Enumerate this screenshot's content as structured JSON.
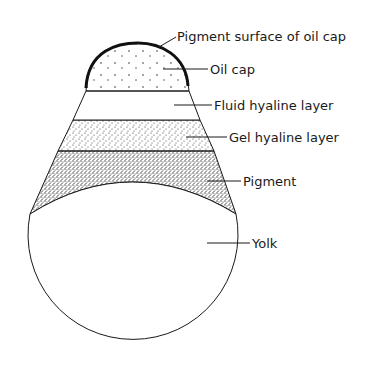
{
  "diagram": {
    "type": "labeled-cross-section",
    "labels": [
      {
        "id": "pigment-surface",
        "text": "Pigment surface of oil cap"
      },
      {
        "id": "oil-cap",
        "text": "Oil cap"
      },
      {
        "id": "fluid-hyaline",
        "text": "Fluid hyaline layer"
      },
      {
        "id": "gel-hyaline",
        "text": "Gel hyaline layer"
      },
      {
        "id": "pigment",
        "text": "Pigment"
      },
      {
        "id": "yolk",
        "text": "Yolk"
      }
    ],
    "colors": {
      "outline": "#1a1a1a",
      "background": "#ffffff"
    }
  }
}
